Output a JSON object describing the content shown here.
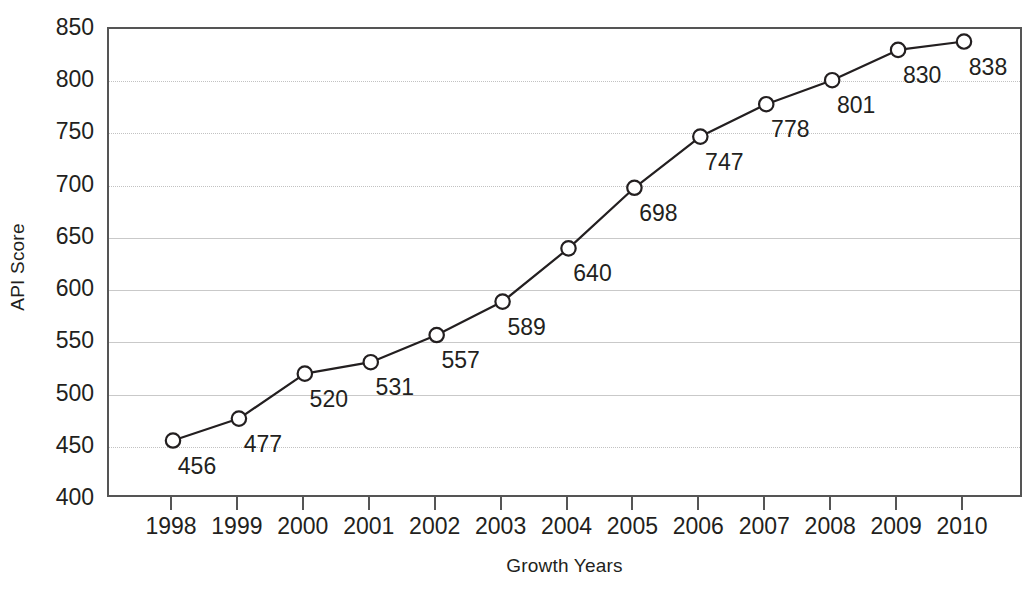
{
  "chart_data": {
    "type": "line",
    "title": "",
    "subtitle": "",
    "xlabel": "Growth Years",
    "ylabel": "API Score",
    "categories": [
      "1998",
      "1999",
      "2000",
      "2001",
      "2002",
      "2003",
      "2004",
      "2005",
      "2006",
      "2007",
      "2008",
      "2009",
      "2010"
    ],
    "values": [
      456,
      477,
      520,
      531,
      557,
      589,
      640,
      698,
      747,
      778,
      801,
      830,
      838
    ],
    "point_labels": [
      "456",
      "477",
      "520",
      "531",
      "557",
      "589",
      "640",
      "698",
      "747",
      "778",
      "801",
      "830",
      "838"
    ],
    "ylim": [
      400,
      850
    ],
    "y_ticks": [
      850,
      800,
      750,
      700,
      650,
      600,
      550,
      500,
      450,
      400
    ],
    "y_tick_labels": [
      "850",
      "800",
      "750",
      "700",
      "650",
      "600",
      "550",
      "500",
      "450",
      "400"
    ],
    "grid": true,
    "grid_axis": "y",
    "legend": false,
    "legend_position": "none",
    "marker": "open-circle",
    "series": [
      {
        "name": "API Score",
        "values": [
          456,
          477,
          520,
          531,
          557,
          589,
          640,
          698,
          747,
          778,
          801,
          830,
          838
        ]
      }
    ]
  },
  "style": {
    "background_color": "#ffffff",
    "line_color": "#231f20",
    "marker_face_color": "#ffffff",
    "marker_edge_color": "#231f20",
    "gridline_color": "#c9c9c9",
    "axis_color": "#555555",
    "text_color": "#231f20"
  }
}
